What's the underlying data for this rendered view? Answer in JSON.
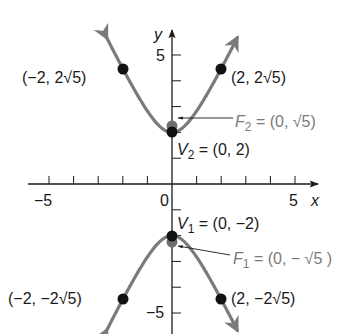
{
  "figure": {
    "type": "hyperbola-graph",
    "equation_implied": "y^2/4 - x^2 = 1",
    "colors": {
      "curve": "#7a7a7a",
      "axis": "#1a1a1a",
      "point": "#111111",
      "focus_point": "#6e6e6e",
      "focus_label": "#7a7a7a"
    }
  },
  "axes": {
    "x_label": "x",
    "y_label": "y",
    "x_range": [
      -5,
      5
    ],
    "y_range": [
      -5,
      5
    ],
    "tick_labels": {
      "x_neg5": "−5",
      "x_0": "0",
      "x_5": "5",
      "y_5": "5",
      "y_neg5": "−5"
    }
  },
  "points": [
    {
      "id": "p1",
      "x": -2,
      "y": 4.472,
      "label": "(−2, 2√5)"
    },
    {
      "id": "p2",
      "x": 2,
      "y": 4.472,
      "label": "(2, 2√5)"
    },
    {
      "id": "p3",
      "x": -2,
      "y": -4.472,
      "label": "(−2, −2√5)"
    },
    {
      "id": "p4",
      "x": 2,
      "y": -4.472,
      "label": "(2, −2√5)"
    }
  ],
  "vertices": {
    "v2": {
      "x": 0,
      "y": 2,
      "name": "V",
      "sub": "2",
      "rest": " = (0, 2)"
    },
    "v1": {
      "x": 0,
      "y": -2,
      "name": "V",
      "sub": "1",
      "rest": " = (0, −2)"
    }
  },
  "foci": {
    "f2": {
      "x": 0,
      "y": 2.236,
      "name": "F",
      "sub": "2",
      "rest": " = (0, √5)"
    },
    "f1": {
      "x": 0,
      "y": -2.236,
      "name": "F",
      "sub": "1",
      "rest": " = (0, − √5 )"
    }
  }
}
